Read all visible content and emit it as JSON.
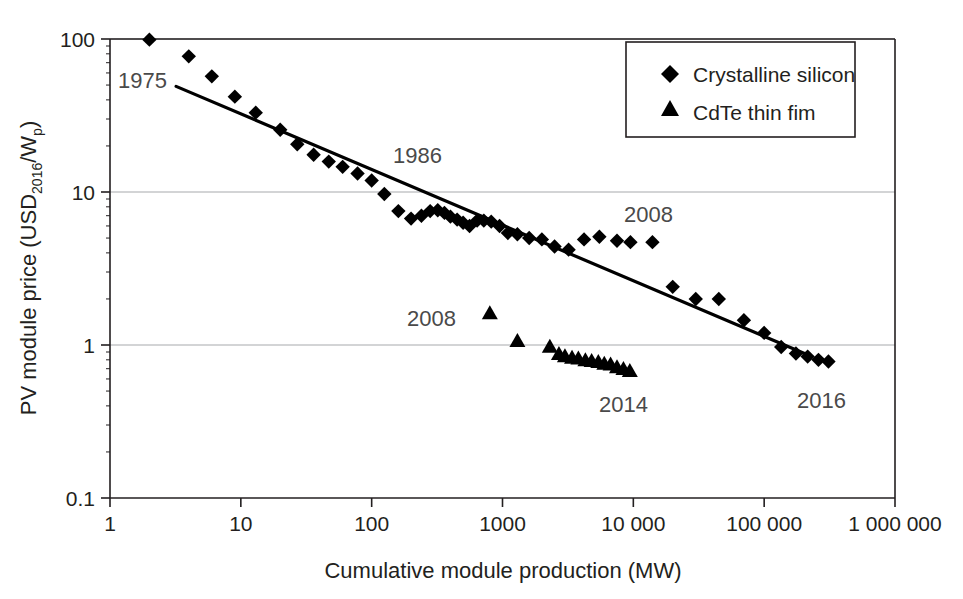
{
  "chart_data": {
    "type": "scatter",
    "title": "",
    "xlabel": "Cumulative module production (MW)",
    "ylabel_parts": {
      "main_prefix": "PV module price (USD",
      "sub": "2016",
      "main_mid": "/W",
      "sub2": "p",
      "main_suffix": ")"
    },
    "ylabel": "PV module price (USD2016/Wp)",
    "xscale": "log",
    "yscale": "log",
    "xlim": [
      1,
      1000000
    ],
    "ylim": [
      0.1,
      100
    ],
    "xticks": [
      1,
      10,
      100,
      1000,
      10000,
      100000,
      1000000
    ],
    "xtick_labels": [
      "1",
      "10",
      "100",
      "1000",
      "10 000",
      "100 000",
      "1 000 000"
    ],
    "yticks": [
      0.1,
      1,
      10,
      100
    ],
    "ytick_labels": [
      "0.1",
      "1",
      "10",
      "100"
    ],
    "grid": "horizontal-major",
    "legend_position": "top-right",
    "series": [
      {
        "name": "Crystalline silicon",
        "marker": "diamond",
        "color": "#000000",
        "points": [
          [
            2.0,
            99.0
          ],
          [
            4.0,
            77.0
          ],
          [
            6.0,
            57.0
          ],
          [
            9.0,
            42.0
          ],
          [
            13.0,
            33.0
          ],
          [
            20.0,
            25.5
          ],
          [
            27.0,
            20.5
          ],
          [
            36.0,
            17.5
          ],
          [
            47.0,
            15.8
          ],
          [
            60.0,
            14.6
          ],
          [
            78.0,
            13.2
          ],
          [
            100.0,
            11.9
          ],
          [
            125.0,
            9.7
          ],
          [
            160.0,
            7.5
          ],
          [
            200.0,
            6.7
          ],
          [
            240.0,
            7.0
          ],
          [
            280.0,
            7.5
          ],
          [
            320.0,
            7.6
          ],
          [
            360.0,
            7.3
          ],
          [
            400.0,
            6.9
          ],
          [
            450.0,
            6.6
          ],
          [
            500.0,
            6.3
          ],
          [
            560.0,
            6.0
          ],
          [
            640.0,
            6.5
          ],
          [
            720.0,
            6.5
          ],
          [
            820.0,
            6.4
          ],
          [
            950.0,
            6.0
          ],
          [
            1100.0,
            5.4
          ],
          [
            1300.0,
            5.3
          ],
          [
            1600.0,
            5.0
          ],
          [
            2000.0,
            4.9
          ],
          [
            2500.0,
            4.4
          ],
          [
            3200.0,
            4.2
          ],
          [
            4200.0,
            4.9
          ],
          [
            5500.0,
            5.1
          ],
          [
            7500.0,
            4.8
          ],
          [
            9500.0,
            4.7
          ],
          [
            14000.0,
            4.7
          ],
          [
            20000.0,
            2.4
          ],
          [
            30000.0,
            2.0
          ],
          [
            45000.0,
            2.0
          ],
          [
            70000.0,
            1.45
          ],
          [
            100000.0,
            1.2
          ],
          [
            135000.0,
            0.97
          ],
          [
            175000.0,
            0.88
          ],
          [
            215000.0,
            0.84
          ],
          [
            260000.0,
            0.8
          ],
          [
            310000.0,
            0.78
          ]
        ]
      },
      {
        "name": "CdTe thin fim",
        "marker": "triangle",
        "color": "#000000",
        "points": [
          [
            800.0,
            1.62
          ],
          [
            1300.0,
            1.07
          ],
          [
            2300.0,
            0.98
          ],
          [
            2700.0,
            0.88
          ],
          [
            3000.0,
            0.85
          ],
          [
            3400.0,
            0.83
          ],
          [
            3800.0,
            0.82
          ],
          [
            4300.0,
            0.8
          ],
          [
            4800.0,
            0.79
          ],
          [
            5400.0,
            0.78
          ],
          [
            6000.0,
            0.76
          ],
          [
            6700.0,
            0.75
          ],
          [
            7500.0,
            0.72
          ],
          [
            8400.0,
            0.7
          ],
          [
            9400.0,
            0.68
          ]
        ]
      }
    ],
    "trendline": {
      "name": "experience-curve-fit",
      "x_start": 3.2,
      "y_start": 49.0,
      "x_end": 210000.0,
      "y_end": 0.87,
      "color": "#000000"
    },
    "annotations": [
      {
        "id": "annot-1975",
        "text": "1975",
        "x_px": 118,
        "y_px": 88
      },
      {
        "id": "annot-1986",
        "text": "1986",
        "x_px": 393,
        "y_px": 163
      },
      {
        "id": "annot-2008-silicon",
        "text": "2008",
        "x_px": 624,
        "y_px": 222
      },
      {
        "id": "annot-2008-cdte",
        "text": "2008",
        "x_px": 407,
        "y_px": 326
      },
      {
        "id": "annot-2014",
        "text": "2014",
        "x_px": 599,
        "y_px": 412
      },
      {
        "id": "annot-2016",
        "text": "2016",
        "x_px": 797,
        "y_px": 408
      }
    ]
  },
  "legend": {
    "items": [
      {
        "marker": "diamond-marker",
        "label": "Crystalline silicon"
      },
      {
        "marker": "triangle-marker",
        "label": "CdTe thin fim"
      }
    ]
  },
  "colors": {
    "ink": "#231f20",
    "marker": "#000000",
    "grid": "#a7a9ac",
    "axis": "#231f20",
    "background": "#ffffff"
  }
}
